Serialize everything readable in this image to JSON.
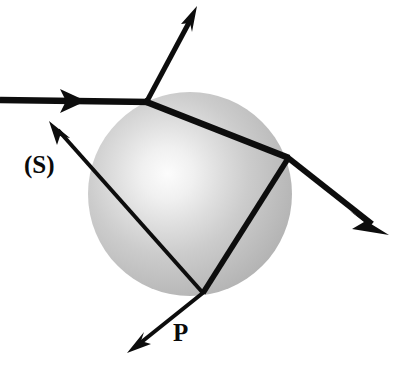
{
  "figure": {
    "background_color": "#ffffff",
    "stroke_color": "#0d0d0d",
    "width": 393,
    "height": 373
  },
  "sphere": {
    "name": "water-droplet",
    "center_x": 190,
    "center_y": 194,
    "radius": 102,
    "highlight_x": 162,
    "highlight_y": 176,
    "highlight_color": "#fdfdfd",
    "mid_color": "#c9c9c9",
    "edge_color": "#a8a8a8",
    "outline": false
  },
  "rays": [
    {
      "name": "incident-ray",
      "label": "",
      "from_x": 0,
      "from_y": 100,
      "to_x": 146,
      "to_y": 102,
      "thickness": 6,
      "arrow": "mid",
      "arrow_x": 80,
      "arrow_y": 101
    },
    {
      "name": "reflected-ray",
      "label": "",
      "from_x": 146,
      "from_y": 102,
      "to_x": 196,
      "to_y": 8,
      "thickness": 5,
      "arrow": "end"
    },
    {
      "name": "internal-chord-entry-to-right",
      "label": "",
      "from_x": 146,
      "from_y": 102,
      "to_x": 288,
      "to_y": 158,
      "thickness": 6,
      "arrow": "none"
    },
    {
      "name": "transmitted-exit-ray",
      "label": "",
      "from_x": 288,
      "from_y": 158,
      "to_x": 388,
      "to_y": 234,
      "thickness": 6,
      "arrow": "end"
    },
    {
      "name": "internal-chord-right-to-bottom",
      "label": "",
      "from_x": 288,
      "from_y": 158,
      "to_x": 203,
      "to_y": 292,
      "thickness": 5,
      "arrow": "none"
    },
    {
      "name": "internal-chord-bottom-to-left",
      "label": "(S)",
      "from_x": 203,
      "from_y": 292,
      "to_x": 52,
      "to_y": 124,
      "thickness": 4,
      "arrow": "end"
    },
    {
      "name": "exit-ray-p",
      "label": "P",
      "from_x": 203,
      "from_y": 292,
      "to_x": 129,
      "to_y": 351,
      "thickness": 4,
      "arrow": "end"
    }
  ],
  "vertices": [
    {
      "name": "entry-point",
      "x": 146,
      "y": 102
    },
    {
      "name": "right-internal-reflection-point",
      "x": 288,
      "y": 158
    },
    {
      "name": "bottom-internal-reflection-point",
      "x": 203,
      "y": 292
    }
  ],
  "labels": {
    "s_label": "(S)",
    "p_label": "P"
  }
}
